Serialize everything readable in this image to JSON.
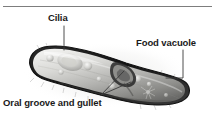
{
  "figure": {
    "style": "grayscale micrograph illustration with callout labels",
    "background_color": "#ffffff",
    "rule_color": "#7d7d7d",
    "label_color": "#1a1a1a",
    "leader_color": "#3a3a3a"
  },
  "labels": {
    "cilia": "Cilia",
    "food_vacuole": "Food vacuole",
    "oral_groove": "Oral groove and gullet"
  },
  "organism": {
    "name": "paramecium-body",
    "tilt_degrees": 20,
    "outline_color": "#1c1c1c",
    "body_light": "#e8e8e6",
    "body_mid": "#b9b9b6",
    "body_dark": "#6e6e6c"
  }
}
